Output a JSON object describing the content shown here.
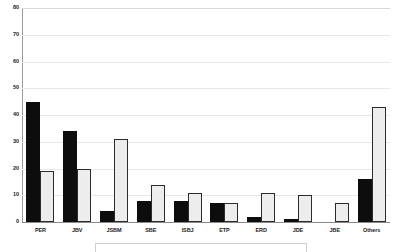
{
  "chart_data": {
    "type": "bar",
    "title": "",
    "subtitle": "",
    "xlabel": "",
    "ylabel": "",
    "ylim": [
      0,
      80
    ],
    "yticks": [
      0,
      10,
      20,
      30,
      40,
      50,
      60,
      70,
      80
    ],
    "ytick_labels": [
      "0",
      "10",
      "20",
      "30",
      "40",
      "50",
      "60",
      "70",
      "80"
    ],
    "grid": true,
    "grid_axis": "y",
    "legend": false,
    "legend_position": "none",
    "categories": [
      "PER",
      "JBV",
      "JSBM",
      "SBE",
      "ISBJ",
      "ETP",
      "ERD",
      "JDE",
      "JBE",
      "Others"
    ],
    "series": [
      {
        "name": "Series 1",
        "color": "#0d0d0d",
        "style": "filled-black",
        "values": [
          45,
          34,
          4,
          8,
          8,
          7,
          2,
          1,
          0,
          16
        ]
      },
      {
        "name": "Series 2",
        "color": "#ededed",
        "style": "outlined-white",
        "values": [
          19,
          20,
          31,
          14,
          11,
          7,
          11,
          10,
          7,
          43
        ]
      }
    ]
  },
  "axis": {
    "y_max_label": "80",
    "y_min_label": "0"
  }
}
